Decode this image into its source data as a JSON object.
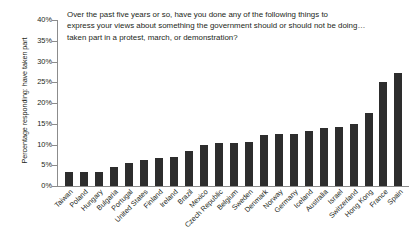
{
  "chart_data": {
    "type": "bar",
    "title_lines": [
      "Over the past five years or so, have you done any of the following things to",
      "express your views about something the government should or should not be doing…",
      "taken part in a protest, march, or demonstration?"
    ],
    "xlabel": "",
    "ylabel": "Percentage responding: have taken part",
    "ylim": [
      0,
      40
    ],
    "ytick_labels": [
      "0%",
      "5%",
      "10%",
      "15%",
      "20%",
      "25%",
      "30%",
      "35%",
      "40%"
    ],
    "ytick_values": [
      0,
      5,
      10,
      15,
      20,
      25,
      30,
      35,
      40
    ],
    "grid": false,
    "legend": "none",
    "bar_color": "#2d2d2d",
    "axis_color": "#8c8c8c",
    "categories": [
      "Taiwan",
      "Poland",
      "Hungary",
      "Bulgaria",
      "Portugal",
      "United States",
      "Finland",
      "Ireland",
      "Brazil",
      "Mexico",
      "Czech Republic",
      "Belgium",
      "Sweden",
      "Denmark",
      "Norway",
      "Germany",
      "Iceland",
      "Australia",
      "Israel",
      "Switzerland",
      "Hong Kong",
      "France",
      "Spain"
    ],
    "values": [
      3.4,
      3.4,
      3.3,
      4.5,
      5.5,
      6.3,
      6.8,
      7.0,
      8.5,
      9.8,
      10.3,
      10.4,
      10.5,
      12.4,
      12.6,
      12.6,
      13.2,
      14.0,
      14.3,
      15.0,
      17.5,
      25.0,
      27.2
    ]
  }
}
